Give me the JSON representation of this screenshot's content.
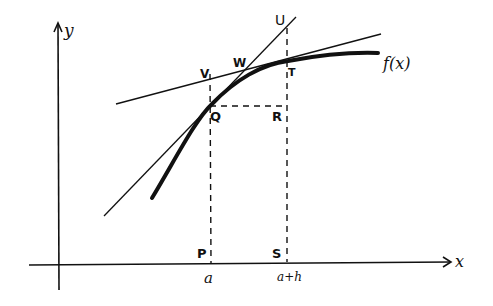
{
  "diagram": {
    "title": "",
    "axes": {
      "x_label": "x",
      "y_label": "y"
    },
    "curve": {
      "label": "f(x)"
    },
    "points": {
      "P": "P",
      "Q": "Q",
      "R": "R",
      "S": "S",
      "T": "T",
      "U": "U",
      "V": "V",
      "W": "W"
    },
    "x_ticks": {
      "a": "a",
      "a_plus_h": "a+h"
    },
    "lines": [
      "tangent at Q (through Q and U)",
      "tangent at T (through V, W, T)",
      "dashed vertical Q–P",
      "dashed vertical U–S",
      "dashed horizontal Q–R"
    ]
  }
}
